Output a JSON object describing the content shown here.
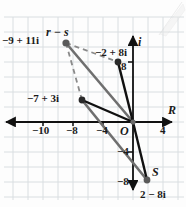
{
  "figure": {
    "type": "complex-plane-vector-diagram",
    "axes": {
      "real_axis_label": "R",
      "imaginary_axis_label": "i",
      "origin_label": "O",
      "x_ticks": [
        "-10",
        "-8",
        "-4",
        "4"
      ],
      "y_ticks": [
        "8",
        "-4",
        "-8"
      ],
      "grid": true,
      "grid_step_units": 2,
      "xlim": [
        -12,
        6
      ],
      "ylim": [
        -11,
        13
      ]
    },
    "points": [
      {
        "id": "p-r-minus-s",
        "label": "-9 + 11i",
        "re": -9,
        "im": 11,
        "color": "#4a4a4a",
        "vector_label": "r - s"
      },
      {
        "id": "p-r",
        "label": "-2 + 8i",
        "re": -2,
        "im": 8,
        "color": "#1a1a1a",
        "tick_label": "8"
      },
      {
        "id": "p-sum",
        "label": "-7 + 3i",
        "re": -7,
        "im": 3,
        "color": "#1a1a1a"
      },
      {
        "id": "p-s",
        "label": "2 - 8i",
        "re": 2,
        "im": -8,
        "color": "#4a4a4a",
        "vector_label": "S"
      }
    ],
    "labels": {
      "r_minus_s": "r − s",
      "p_r_minus_s": "−9 + 11i",
      "p_minus2_8i": "−2 + 8i",
      "p_minus7_3i": "−7 + 3i",
      "p_2_minus_8i": "2 − 8i",
      "s_point": "S",
      "tick_8": "8",
      "tick_neg4": "−4",
      "tick_neg8": "−8",
      "tick_neg10": "−10",
      "tick_neg8x": "−8",
      "tick_neg4x": "−4",
      "tick_4": "4",
      "axis_R": "R",
      "axis_i": "i",
      "origin": "O"
    },
    "colors": {
      "grid": "#d8dde0",
      "axis": "#1a1a1a",
      "vector_gray": "#6b6b6b",
      "vector_black": "#111111",
      "dashed": "#8a8a8a",
      "text": "#1a1a1a"
    }
  }
}
